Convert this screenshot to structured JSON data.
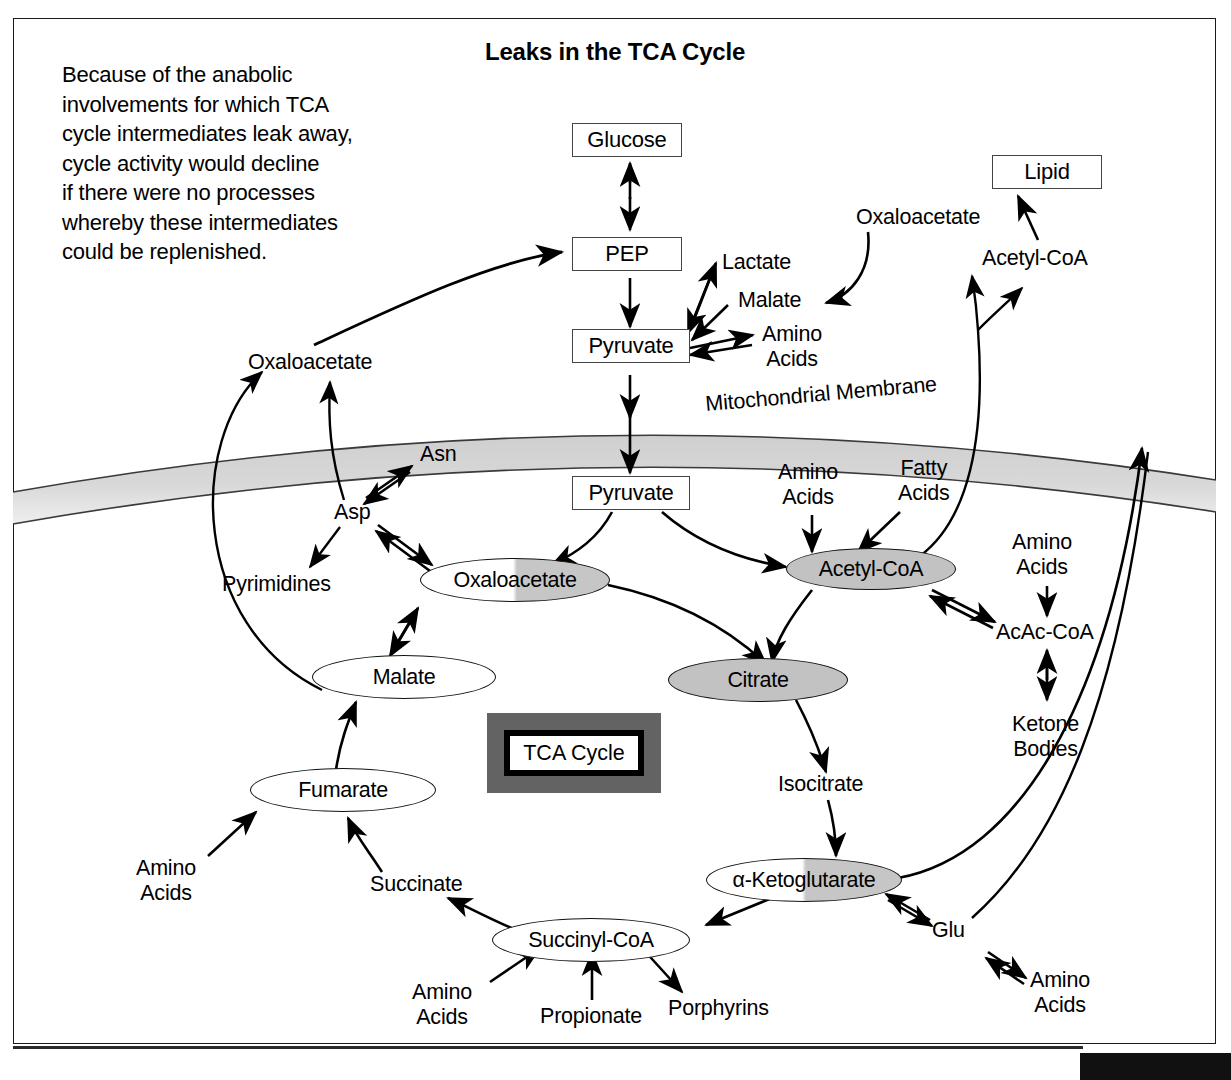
{
  "title": "Leaks in the TCA Cycle",
  "intro": "Because of the anabolic\ninvolvements for which TCA\ncycle intermediates leak away,\ncycle activity would decline\nif there were no processes\nwhereby these intermediates\ncould be replenished.",
  "legend": {
    "label": "TCA Cycle"
  },
  "membrane_label": "Mitochondrial Membrane",
  "boxes": [
    {
      "id": "glucose",
      "label": "Glucose"
    },
    {
      "id": "pep",
      "label": "PEP"
    },
    {
      "id": "lipid",
      "label": "Lipid"
    },
    {
      "id": "pyruvate_cytosol",
      "label": "Pyruvate"
    },
    {
      "id": "pyruvate_mito",
      "label": "Pyruvate"
    }
  ],
  "ovals": [
    {
      "id": "oxaloacetate_cycle",
      "label": "Oxaloacetate",
      "fill": "half"
    },
    {
      "id": "acetyl_coa_cycle",
      "label": "Acetyl-CoA",
      "fill": "gray"
    },
    {
      "id": "citrate",
      "label": "Citrate",
      "fill": "gray"
    },
    {
      "id": "malate_cycle",
      "label": "Malate",
      "fill": "white"
    },
    {
      "id": "fumarate",
      "label": "Fumarate",
      "fill": "white"
    },
    {
      "id": "succinyl_coa",
      "label": "Succinyl-CoA",
      "fill": "white"
    },
    {
      "id": "alpha_ketoglutarate",
      "label": "α-Ketoglutarate",
      "fill": "half"
    }
  ],
  "labels": [
    {
      "id": "lactate",
      "label": "Lactate"
    },
    {
      "id": "malate_cytosol",
      "label": "Malate"
    },
    {
      "id": "amino_acids_pyruvate",
      "label": "Amino\nAcids"
    },
    {
      "id": "oxaloacetate_cytosol_right",
      "label": "Oxaloacetate"
    },
    {
      "id": "acetyl_coa_cytosol",
      "label": "Acetyl-CoA"
    },
    {
      "id": "oxaloacetate_cytosol_left",
      "label": "Oxaloacetate"
    },
    {
      "id": "asn",
      "label": "Asn"
    },
    {
      "id": "asp",
      "label": "Asp"
    },
    {
      "id": "pyrimidines",
      "label": "Pyrimidines"
    },
    {
      "id": "amino_acids_acetyl",
      "label": "Amino\nAcids"
    },
    {
      "id": "fatty_acids",
      "label": "Fatty\nAcids"
    },
    {
      "id": "amino_acids_acac",
      "label": "Amino\nAcids"
    },
    {
      "id": "acac_coa",
      "label": "AcAc-CoA"
    },
    {
      "id": "ketone_bodies",
      "label": "Ketone\nBodies"
    },
    {
      "id": "isocitrate",
      "label": "Isocitrate"
    },
    {
      "id": "succinate",
      "label": "Succinate"
    },
    {
      "id": "amino_acids_fumarate",
      "label": "Amino\nAcids"
    },
    {
      "id": "amino_acids_succinyl",
      "label": "Amino\nAcids"
    },
    {
      "id": "propionate",
      "label": "Propionate"
    },
    {
      "id": "porphyrins",
      "label": "Porphyrins"
    },
    {
      "id": "glu",
      "label": "Glu"
    },
    {
      "id": "amino_acids_glu",
      "label": "Amino\nAcids"
    }
  ],
  "colors": {
    "ink": "#000000",
    "gray_fill": "#c2c2c2",
    "legend_bg": "#636363",
    "membrane_fill": "#d4d4d4"
  }
}
